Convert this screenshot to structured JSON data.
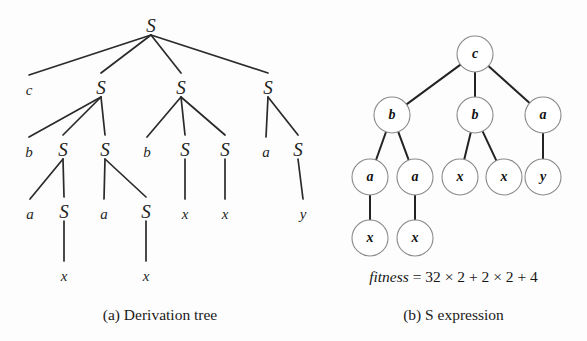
{
  "figure": {
    "background_color": "#fdfdfd",
    "ink_color": "#1f1f1f",
    "circle_stroke_color": "#8a8a8a"
  },
  "panel_a": {
    "caption": "(a) Derivation tree",
    "type": "derivation-tree",
    "nodes": [
      {
        "id": "n0",
        "label": "S",
        "kind": "nonterminal",
        "x": 151,
        "y": 28,
        "row": 0
      },
      {
        "id": "n1",
        "label": "c",
        "kind": "terminal",
        "x": 29,
        "y": 92,
        "row": 1
      },
      {
        "id": "n2",
        "label": "S",
        "kind": "nonterminal",
        "x": 101,
        "y": 90,
        "row": 1
      },
      {
        "id": "n3",
        "label": "S",
        "kind": "nonterminal",
        "x": 181,
        "y": 90,
        "row": 1
      },
      {
        "id": "n4",
        "label": "S",
        "kind": "nonterminal",
        "x": 268,
        "y": 90,
        "row": 1
      },
      {
        "id": "n5",
        "label": "b",
        "kind": "terminal",
        "x": 29,
        "y": 154,
        "row": 2
      },
      {
        "id": "n6",
        "label": "S",
        "kind": "nonterminal",
        "x": 63,
        "y": 152,
        "row": 2
      },
      {
        "id": "n7",
        "label": "S",
        "kind": "nonterminal",
        "x": 105,
        "y": 152,
        "row": 2
      },
      {
        "id": "n8",
        "label": "b",
        "kind": "terminal",
        "x": 147,
        "y": 154,
        "row": 2
      },
      {
        "id": "n9",
        "label": "S",
        "kind": "nonterminal",
        "x": 185,
        "y": 152,
        "row": 2
      },
      {
        "id": "n10",
        "label": "S",
        "kind": "nonterminal",
        "x": 225,
        "y": 152,
        "row": 2
      },
      {
        "id": "n11",
        "label": "a",
        "kind": "terminal",
        "x": 266,
        "y": 154,
        "row": 2
      },
      {
        "id": "n12",
        "label": "S",
        "kind": "nonterminal",
        "x": 298,
        "y": 152,
        "row": 2
      },
      {
        "id": "n13",
        "label": "a",
        "kind": "terminal",
        "x": 30,
        "y": 216,
        "row": 3
      },
      {
        "id": "n14",
        "label": "S",
        "kind": "nonterminal",
        "x": 64,
        "y": 214,
        "row": 3
      },
      {
        "id": "n15",
        "label": "a",
        "kind": "terminal",
        "x": 104,
        "y": 216,
        "row": 3
      },
      {
        "id": "n16",
        "label": "S",
        "kind": "nonterminal",
        "x": 146,
        "y": 214,
        "row": 3
      },
      {
        "id": "n17",
        "label": "x",
        "kind": "terminal",
        "x": 185,
        "y": 216,
        "row": 3
      },
      {
        "id": "n18",
        "label": "x",
        "kind": "terminal",
        "x": 225,
        "y": 216,
        "row": 3
      },
      {
        "id": "n19",
        "label": "y",
        "kind": "terminal",
        "x": 303,
        "y": 216,
        "row": 3
      },
      {
        "id": "n20",
        "label": "x",
        "kind": "terminal",
        "x": 64,
        "y": 278,
        "row": 4
      },
      {
        "id": "n21",
        "label": "x",
        "kind": "terminal",
        "x": 146,
        "y": 278,
        "row": 4
      }
    ],
    "edges": [
      {
        "from": "n0",
        "to": "n1"
      },
      {
        "from": "n0",
        "to": "n2"
      },
      {
        "from": "n0",
        "to": "n3"
      },
      {
        "from": "n0",
        "to": "n4"
      },
      {
        "from": "n2",
        "to": "n5"
      },
      {
        "from": "n2",
        "to": "n6"
      },
      {
        "from": "n2",
        "to": "n7"
      },
      {
        "from": "n3",
        "to": "n8"
      },
      {
        "from": "n3",
        "to": "n9"
      },
      {
        "from": "n3",
        "to": "n10"
      },
      {
        "from": "n4",
        "to": "n11"
      },
      {
        "from": "n4",
        "to": "n12"
      },
      {
        "from": "n6",
        "to": "n13"
      },
      {
        "from": "n6",
        "to": "n14"
      },
      {
        "from": "n7",
        "to": "n15"
      },
      {
        "from": "n7",
        "to": "n16"
      },
      {
        "from": "n9",
        "to": "n17"
      },
      {
        "from": "n10",
        "to": "n18"
      },
      {
        "from": "n12",
        "to": "n19"
      },
      {
        "from": "n14",
        "to": "n20"
      },
      {
        "from": "n16",
        "to": "n21"
      }
    ]
  },
  "panel_b": {
    "caption": "(b) S expression",
    "type": "s-expression-tree",
    "node_radius": 18,
    "nodes": [
      {
        "id": "m0",
        "label": "c",
        "x": 475,
        "y": 54
      },
      {
        "id": "m1",
        "label": "b",
        "x": 392,
        "y": 115
      },
      {
        "id": "m2",
        "label": "b",
        "x": 475,
        "y": 115
      },
      {
        "id": "m3",
        "label": "a",
        "x": 543,
        "y": 115
      },
      {
        "id": "m4",
        "label": "a",
        "x": 370,
        "y": 177
      },
      {
        "id": "m5",
        "label": "a",
        "x": 415,
        "y": 177
      },
      {
        "id": "m6",
        "label": "x",
        "x": 460,
        "y": 177
      },
      {
        "id": "m7",
        "label": "x",
        "x": 504,
        "y": 177
      },
      {
        "id": "m8",
        "label": "y",
        "x": 543,
        "y": 177
      },
      {
        "id": "m9",
        "label": "x",
        "x": 370,
        "y": 238
      },
      {
        "id": "m10",
        "label": "x",
        "x": 415,
        "y": 238
      }
    ],
    "edges": [
      {
        "from": "m0",
        "to": "m1"
      },
      {
        "from": "m0",
        "to": "m2"
      },
      {
        "from": "m0",
        "to": "m3"
      },
      {
        "from": "m1",
        "to": "m4"
      },
      {
        "from": "m1",
        "to": "m5"
      },
      {
        "from": "m2",
        "to": "m6"
      },
      {
        "from": "m2",
        "to": "m7"
      },
      {
        "from": "m3",
        "to": "m8"
      },
      {
        "from": "m4",
        "to": "m9"
      },
      {
        "from": "m5",
        "to": "m10"
      }
    ],
    "fitness": {
      "name": "fitness",
      "equals": "=",
      "terms": [
        "32",
        "×",
        "2",
        "+",
        "2",
        "×",
        "2",
        "+",
        "4"
      ],
      "full_text": "fitness = 32 × 2 + 2 × 2 + 4",
      "value": 72
    }
  }
}
